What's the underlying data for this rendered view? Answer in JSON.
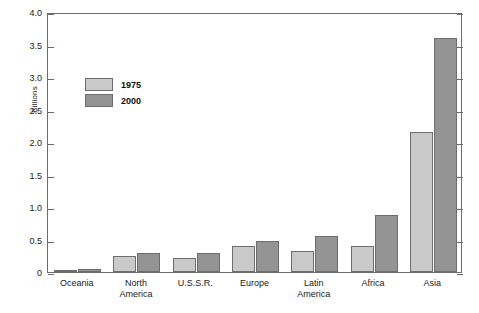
{
  "chart_data": {
    "type": "bar",
    "title": "",
    "xlabel": "",
    "ylabel": "Billions",
    "ylim": [
      0,
      4.0
    ],
    "ytick_step": 0.5,
    "yticks": [
      "0",
      "0.5",
      "1.0",
      "1.5",
      "2.0",
      "2.5",
      "3.0",
      "3.5",
      "4.0"
    ],
    "grid": false,
    "legend_position": "upper-left-inside",
    "categories": [
      "Oceania",
      "North\nAmerica",
      "U.S.S.R.",
      "Europe",
      "Latin\nAmerica",
      "Africa",
      "Asia"
    ],
    "series": [
      {
        "name": "1975",
        "color": "#c9c9c9",
        "values": [
          0.02,
          0.24,
          0.22,
          0.4,
          0.33,
          0.4,
          2.15
        ]
      },
      {
        "name": "2000",
        "color": "#949494",
        "values": [
          0.04,
          0.29,
          0.29,
          0.48,
          0.56,
          0.88,
          3.6
        ]
      }
    ]
  },
  "legend": {
    "items": [
      {
        "label": "1975"
      },
      {
        "label": "2000"
      }
    ]
  },
  "axis": {
    "y_title": "Billions"
  },
  "style": {
    "series_1975_color": "#c9c9c9",
    "series_2000_color": "#949494",
    "axis_color": "#6d6d6d",
    "background": "#ffffff"
  }
}
